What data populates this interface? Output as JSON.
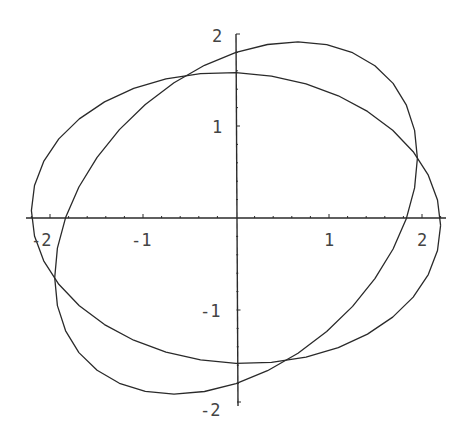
{
  "chart_data": {
    "type": "line",
    "subtype": "parametric",
    "title": "",
    "xlabel": "",
    "ylabel": "",
    "xlim": [
      -2.25,
      2.25
    ],
    "ylim": [
      -2.05,
      2.05
    ],
    "grid": false,
    "legend": null,
    "axes_origin": [
      0,
      0
    ],
    "x_ticks": [
      -2,
      -1,
      1,
      2
    ],
    "y_ticks": [
      -2,
      -1,
      1,
      2
    ],
    "x_tick_labels": [
      "-2",
      "-1",
      "1",
      "2"
    ],
    "y_tick_labels": [
      "-2",
      "-1",
      "1",
      "2"
    ],
    "minor_ticks_per_unit": 5,
    "series": [
      {
        "name": "curve-1",
        "description": "wide ellipse, roughly horizontal",
        "param": {
          "x": "2.2*cos(t)",
          "y": "1.58*sin(t) - 0.08*cos(t)",
          "t_range": [
            0,
            6.2832
          ]
        },
        "key_points": [
          [
            2.2,
            -0.08
          ],
          [
            0,
            1.58
          ],
          [
            -2.2,
            0.08
          ],
          [
            0,
            -1.58
          ],
          [
            -0.75,
            1.55
          ],
          [
            1.9,
            0.7
          ],
          [
            -1.9,
            -0.7
          ],
          [
            0.65,
            -1.55
          ]
        ]
      },
      {
        "name": "curve-2",
        "description": "tilted ellipse",
        "param": {
          "x": "1.95*cos(t)",
          "y": "1.8*sin(t) + 0.65*cos(t)",
          "t_range": [
            0,
            6.2832
          ]
        },
        "key_points": [
          [
            1.95,
            0.65
          ],
          [
            0,
            1.8
          ],
          [
            -1.95,
            -0.65
          ],
          [
            0,
            -1.8
          ],
          [
            0.66,
            1.91
          ],
          [
            -0.66,
            -1.91
          ],
          [
            1.83,
            0
          ],
          [
            -1.83,
            0
          ]
        ]
      }
    ]
  },
  "plot": {
    "labels": {
      "x_neg2": "-2",
      "x_neg1": "-1",
      "x_pos1": "1",
      "x_pos2": "2",
      "y_pos2": "2",
      "y_pos1": "1",
      "y_neg1": "-1",
      "y_neg2": "-2"
    }
  }
}
